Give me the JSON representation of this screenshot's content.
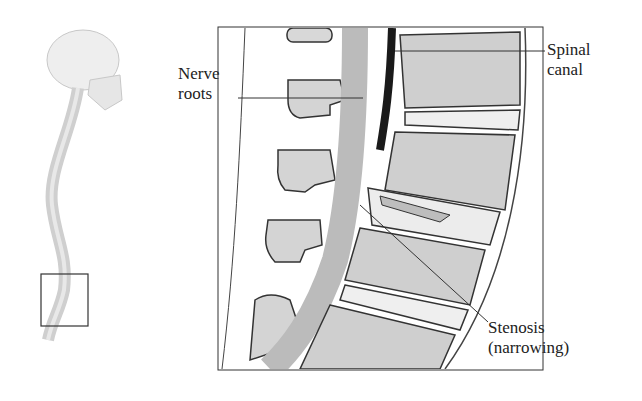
{
  "figure": {
    "overview": {
      "description": "Side view of skeleton skull and spine with lower lumbar region boxed"
    },
    "detail": {
      "description": "Sagittal cross-section of lumbar vertebrae showing narrowed spinal canal"
    },
    "labels": {
      "nerve_roots": [
        "Nerve",
        "roots"
      ],
      "spinal_canal": [
        "Spinal",
        "canal"
      ],
      "stenosis": [
        "Stenosis",
        "(narrowing)"
      ]
    },
    "colors": {
      "line": "#333333",
      "bone": "#d9d9d9",
      "bone_dark": "#8a8a8a",
      "disc": "#ececec",
      "canal": "#1a1a1a"
    }
  }
}
